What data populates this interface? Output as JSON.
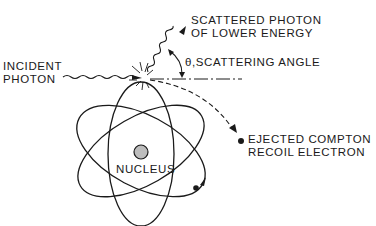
{
  "diagram": {
    "colors": {
      "ink": "#1a1a1a",
      "nucleus_fill": "#bdbdbd",
      "background": "#ffffff"
    },
    "labels": {
      "incident_line1": "INCIDENT",
      "incident_line2": "PHOTON",
      "scattered_line1": "SCATTERED PHOTON",
      "scattered_line2": "OF LOWER ENERGY",
      "angle": "θ,SCATTERING ANGLE",
      "electron_line1": "EJECTED COMPTON",
      "electron_line2": "RECOIL ELECTRON",
      "nucleus": "NUCLEUS"
    }
  }
}
